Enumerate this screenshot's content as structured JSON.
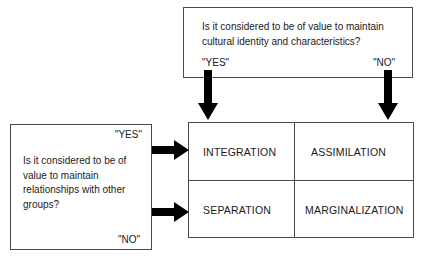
{
  "diagram": {
    "stroke_color": "#4a4a4a",
    "arrow_color": "#000000",
    "text_color": "#1a1a1a",
    "background": "#ffffff"
  },
  "top_question": {
    "text": "Is it considered to be of value to maintain cultural identity and characteristics?",
    "yes_label": "\"YES\"",
    "no_label": "\"NO\""
  },
  "left_question": {
    "text": "Is it considered to be of value to maintain relationships with other groups?",
    "yes_label": "\"YES\"",
    "no_label": "\"NO\""
  },
  "matrix": {
    "quadrants": [
      {
        "id": "integration",
        "label": "INTEGRATION",
        "row": "yes",
        "column": "yes"
      },
      {
        "id": "assimilation",
        "label": "ASSIMILATION",
        "row": "yes",
        "column": "no"
      },
      {
        "id": "separation",
        "label": "SEPARATION",
        "row": "no",
        "column": "yes"
      },
      {
        "id": "marginalization",
        "label": "MARGINALIZATION",
        "row": "no",
        "column": "no"
      }
    ]
  },
  "arrows": [
    {
      "id": "down-yes",
      "direction": "down",
      "from": "top-question-yes",
      "to": "matrix-left-column"
    },
    {
      "id": "down-no",
      "direction": "down",
      "from": "top-question-no",
      "to": "matrix-right-column"
    },
    {
      "id": "right-yes",
      "direction": "right",
      "from": "left-question-yes",
      "to": "matrix-top-row"
    },
    {
      "id": "right-no",
      "direction": "right",
      "from": "left-question-no",
      "to": "matrix-bottom-row"
    }
  ]
}
